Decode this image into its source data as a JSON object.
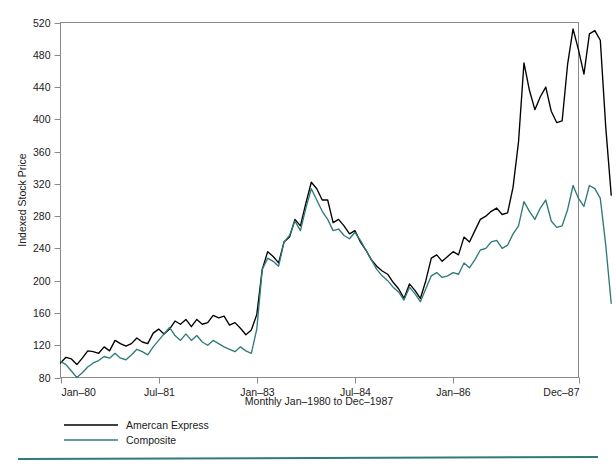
{
  "chart_data": {
    "type": "line",
    "title": "",
    "xlabel": "Monthly Jan–1980 to Dec–1987",
    "ylabel": "Indexed Stock Price",
    "ylim": [
      80,
      520
    ],
    "ytick_values": [
      80,
      120,
      160,
      200,
      240,
      280,
      320,
      360,
      400,
      440,
      480,
      520
    ],
    "ytick_labels": [
      "80",
      "120",
      "160",
      "200",
      "240",
      "280",
      "320",
      "360",
      "400",
      "440",
      "480",
      "520"
    ],
    "xtick_positions": [
      0,
      18,
      36,
      54,
      72,
      95
    ],
    "xtick_labels": [
      "Jan–80",
      "Jul–81",
      "Jan–83",
      "Jul–84",
      "Jan–86",
      "Dec–87"
    ],
    "xlim": [
      0,
      95
    ],
    "grid": false,
    "legend_position": "below-axes-left",
    "n_points": 96,
    "series": [
      {
        "name": "Amercan Express",
        "color": "#000000",
        "values": [
          98,
          105,
          103,
          96,
          104,
          113,
          112,
          110,
          118,
          113,
          126,
          122,
          119,
          122,
          129,
          124,
          122,
          135,
          140,
          134,
          140,
          150,
          146,
          152,
          143,
          152,
          146,
          148,
          157,
          154,
          156,
          145,
          148,
          141,
          133,
          139,
          158,
          214,
          236,
          230,
          222,
          248,
          254,
          276,
          268,
          296,
          322,
          314,
          300,
          300,
          272,
          276,
          268,
          258,
          262,
          248,
          238,
          226,
          218,
          212,
          208,
          198,
          190,
          178,
          196,
          188,
          178,
          200,
          228,
          232,
          224,
          230,
          236,
          232,
          254,
          248,
          262,
          276,
          280,
          286,
          290,
          282,
          284,
          316,
          372,
          470,
          436,
          412,
          428,
          440,
          410,
          396,
          398,
          468,
          512,
          486,
          456,
          506,
          510,
          498,
          390,
          306
        ]
      },
      {
        "name": "Composite",
        "color": "#2f7b77",
        "values": [
          100,
          96,
          88,
          80,
          86,
          93,
          98,
          101,
          106,
          104,
          110,
          104,
          102,
          108,
          115,
          112,
          108,
          118,
          126,
          134,
          142,
          132,
          126,
          134,
          126,
          132,
          124,
          120,
          126,
          122,
          118,
          115,
          112,
          118,
          113,
          110,
          140,
          214,
          228,
          224,
          218,
          248,
          256,
          274,
          262,
          290,
          314,
          300,
          286,
          276,
          262,
          264,
          256,
          252,
          260,
          250,
          238,
          226,
          214,
          206,
          200,
          192,
          186,
          176,
          192,
          184,
          174,
          190,
          206,
          210,
          204,
          206,
          210,
          208,
          222,
          216,
          226,
          238,
          240,
          248,
          250,
          240,
          244,
          258,
          268,
          298,
          286,
          276,
          290,
          300,
          274,
          266,
          268,
          288,
          318,
          302,
          292,
          318,
          314,
          302,
          244,
          172
        ]
      }
    ],
    "footer_rule_color": "#2f7b77"
  },
  "legend": {
    "entries": [
      {
        "label": "Amercan Express",
        "color": "#000000"
      },
      {
        "label": "Composite",
        "color": "#2f7b77"
      }
    ]
  }
}
